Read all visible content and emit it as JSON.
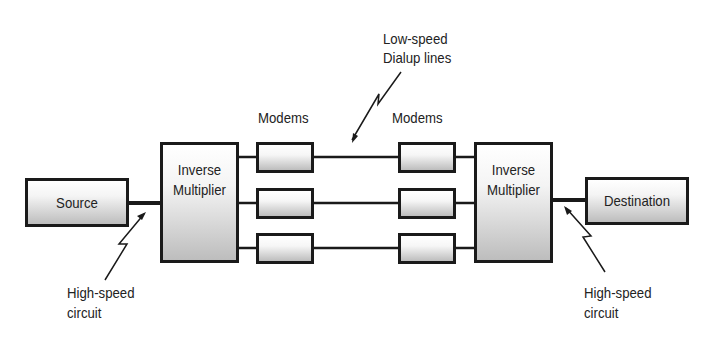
{
  "diagram": {
    "nodes": {
      "source": {
        "label": "Source"
      },
      "left_mux": {
        "line1": "Inverse",
        "line2": "Multiplier"
      },
      "right_mux": {
        "line1": "Inverse",
        "line2": "Multiplier"
      },
      "destination": {
        "label": "Destination"
      }
    },
    "modem_groups": {
      "left": {
        "label": "Modems",
        "count": 3
      },
      "right": {
        "label": "Modems",
        "count": 3
      }
    },
    "annotations": {
      "low_speed": {
        "line1": "Low-speed",
        "line2": "Dialup lines"
      },
      "high_speed_left": {
        "line1": "High-speed",
        "line2": "circuit"
      },
      "high_speed_right": {
        "line1": "High-speed",
        "line2": "circuit"
      }
    },
    "colors": {
      "stroke": "#1a1a1a",
      "fill_top": "#ffffff",
      "fill_bottom": "#bdbdbd"
    }
  }
}
